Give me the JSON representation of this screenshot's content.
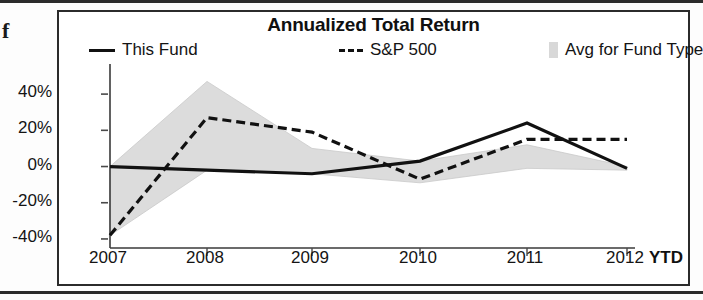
{
  "stray_glyph": "f",
  "chart_data": {
    "type": "line",
    "title": "Annualized Total Return",
    "xlabel": "",
    "ylabel": "",
    "x_axis_note": "YTD",
    "categories": [
      "2007",
      "2008",
      "2009",
      "2010",
      "2011",
      "2012"
    ],
    "tick_labels_y": [
      "40%",
      "20%",
      "0%",
      "-20%",
      "-40%"
    ],
    "y_ticks": [
      40,
      20,
      0,
      -20,
      -40
    ],
    "ylim": [
      -45,
      50
    ],
    "grid": false,
    "legend_position": "top",
    "series": [
      {
        "name": "This Fund",
        "style": "solid",
        "color": "#111111",
        "values": [
          0,
          -2,
          -4,
          3,
          24,
          -1
        ]
      },
      {
        "name": "S&P 500",
        "style": "dashed",
        "color": "#111111",
        "values": [
          -38,
          27,
          19,
          -7,
          15,
          15
        ]
      },
      {
        "name": "Avg for Fund Type",
        "style": "band",
        "color": "#d8d8d8",
        "values": [
          -38,
          47,
          10,
          -5,
          12,
          -1
        ]
      }
    ],
    "band": {
      "name": "Avg for Fund Type",
      "upper": [
        0,
        47,
        10,
        3,
        12,
        0
      ],
      "lower": [
        -38,
        -2,
        -4,
        -9,
        -1,
        -2
      ]
    }
  },
  "legend": {
    "items": [
      {
        "label": "This Fund",
        "marker": "solid-line-icon"
      },
      {
        "label": "S&P 500",
        "marker": "dashed-line-icon"
      },
      {
        "label": "Avg for Fund Type",
        "marker": "band-swatch-icon"
      }
    ]
  }
}
